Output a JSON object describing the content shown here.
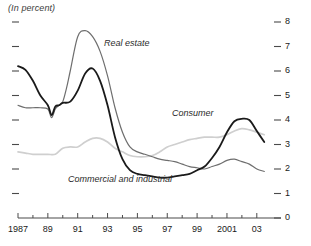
{
  "chart_data": {
    "type": "line",
    "title": "(In percent)",
    "xlabel": "",
    "ylabel": "",
    "xlim": [
      1987,
      2003.75
    ],
    "ylim": [
      0,
      8
    ],
    "grid": false,
    "legend_position": "inline-annotations",
    "y_ticks": [
      "0",
      "1",
      "2",
      "3",
      "4",
      "5",
      "6",
      "7",
      "8"
    ],
    "y_tick_values": [
      0,
      1,
      2,
      3,
      4,
      5,
      6,
      7,
      8
    ],
    "y_axis_side": "right",
    "x_tick_labels": [
      "1987",
      "89",
      "91",
      "93",
      "95",
      "97",
      "99",
      "2001",
      "03"
    ],
    "x_tick_values": [
      1987,
      1989,
      1991,
      1993,
      1995,
      1997,
      1999,
      2001,
      2003
    ],
    "x_minor_tick_values": [
      1988,
      1990,
      1992,
      1994,
      1996,
      1998,
      2000,
      2002
    ],
    "series": [
      {
        "name": "Real estate",
        "color": "#6e6e6e",
        "label_x": 2.0,
        "x": [
          1987.0,
          1987.5,
          1988.0,
          1988.5,
          1989.0,
          1989.25,
          1989.5,
          1989.75,
          1990.0,
          1990.25,
          1990.5,
          1991.0,
          1991.5,
          1992.0,
          1992.5,
          1993.0,
          1993.5,
          1994.0,
          1994.5,
          1995.0,
          1995.5,
          1996.0,
          1996.5,
          1997.0,
          1997.5,
          1998.0,
          1998.5,
          1999.0,
          1999.5,
          2000.0,
          2000.5,
          2001.0,
          2001.5,
          2002.0,
          2002.5,
          2003.0,
          2003.5
        ],
        "values": [
          4.6,
          4.5,
          4.5,
          4.5,
          4.45,
          4.1,
          4.45,
          4.6,
          4.75,
          5.3,
          6.0,
          7.4,
          7.65,
          7.4,
          6.8,
          5.8,
          4.5,
          3.5,
          2.9,
          2.7,
          2.6,
          2.5,
          2.4,
          2.35,
          2.3,
          2.2,
          2.1,
          2.05,
          2.0,
          2.1,
          2.2,
          2.35,
          2.4,
          2.3,
          2.2,
          2.0,
          1.9
        ]
      },
      {
        "name": "Commercial and industrial",
        "color": "#1a1a1a",
        "label_x": 1.5,
        "x": [
          1987.0,
          1987.5,
          1988.0,
          1988.5,
          1989.0,
          1989.25,
          1989.5,
          1989.75,
          1990.0,
          1990.5,
          1991.0,
          1991.5,
          1992.0,
          1992.5,
          1993.0,
          1993.5,
          1994.0,
          1994.5,
          1995.0,
          1995.5,
          1996.0,
          1996.5,
          1997.0,
          1997.5,
          1998.0,
          1998.5,
          1999.0,
          1999.5,
          2000.0,
          2000.5,
          2001.0,
          2001.5,
          2002.0,
          2002.5,
          2003.0,
          2003.5
        ],
        "values": [
          6.2,
          6.05,
          5.6,
          5.0,
          4.6,
          4.2,
          4.55,
          4.6,
          4.7,
          4.75,
          5.2,
          5.9,
          6.1,
          5.6,
          4.6,
          3.3,
          2.4,
          1.95,
          1.8,
          1.75,
          1.7,
          1.65,
          1.65,
          1.7,
          1.75,
          1.8,
          1.95,
          2.1,
          2.45,
          2.9,
          3.5,
          3.95,
          4.05,
          4.0,
          3.55,
          3.1
        ]
      },
      {
        "name": "Consumer",
        "color": "#cfcfcf",
        "label_x": 2.5,
        "x": [
          1987.0,
          1987.5,
          1988.0,
          1988.5,
          1989.0,
          1989.5,
          1990.0,
          1990.5,
          1991.0,
          1991.5,
          1992.0,
          1992.5,
          1993.0,
          1993.5,
          1994.0,
          1994.5,
          1995.0,
          1995.5,
          1996.0,
          1996.5,
          1997.0,
          1997.5,
          1998.0,
          1998.5,
          1999.0,
          1999.5,
          2000.0,
          2000.5,
          2001.0,
          2001.5,
          2002.0,
          2002.5,
          2003.0,
          2003.5
        ],
        "values": [
          2.7,
          2.65,
          2.6,
          2.6,
          2.6,
          2.6,
          2.85,
          2.9,
          2.9,
          3.1,
          3.25,
          3.25,
          3.1,
          2.85,
          2.7,
          2.55,
          2.5,
          2.5,
          2.55,
          2.7,
          2.9,
          3.0,
          3.1,
          3.2,
          3.25,
          3.3,
          3.3,
          3.3,
          3.4,
          3.55,
          3.65,
          3.6,
          3.5,
          3.4
        ]
      }
    ]
  },
  "annotations": {
    "real_estate": "Real estate",
    "consumer": "Consumer",
    "commercial_industrial": "Commercial and industrial"
  }
}
